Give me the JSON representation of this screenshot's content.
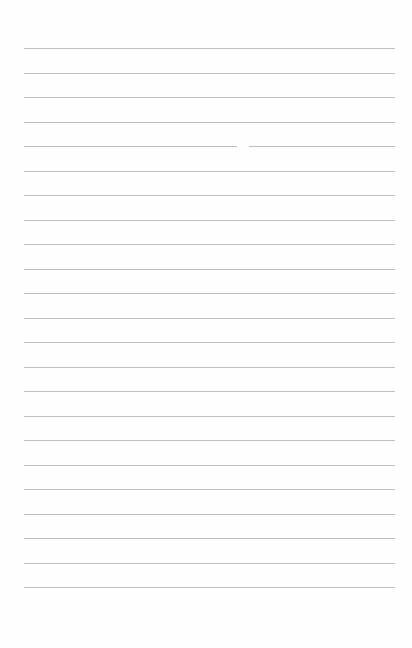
{
  "page": {
    "type": "blank lined paper",
    "line_count": 23,
    "first_line_y": 48,
    "line_spacing": 24.5,
    "line_left_x": 24,
    "line_right_x": 395,
    "line_color": "#bfbfbf",
    "background_color": "#fefefe"
  }
}
